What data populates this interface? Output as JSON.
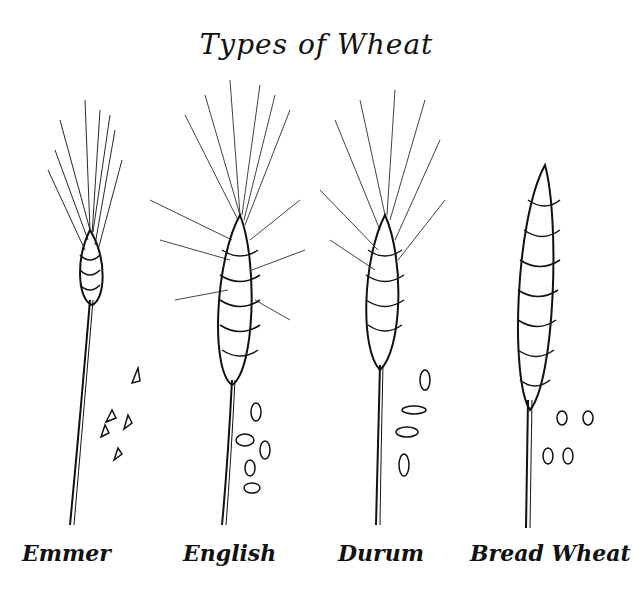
{
  "title": "Types of Wheat",
  "varieties": [
    {
      "name": "Emmer",
      "label_x": 22
    },
    {
      "name": "English",
      "label_x": 183
    },
    {
      "name": "Durum",
      "label_x": 338
    },
    {
      "name": "Bread Wheat",
      "label_x": 470
    }
  ],
  "colors": {
    "ink": "#111111",
    "background": "#ffffff"
  }
}
